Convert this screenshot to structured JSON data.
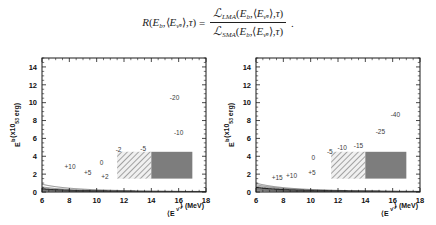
{
  "equation": {
    "lhs_fn": "R",
    "lhs_args": "(E_b, <E_nuebar>, tau)",
    "equals": "=",
    "numerator": "L_LMA(E_b, <E_nuebar>, tau)",
    "denominator": "L_SMA(E_b, <E_nuebar>, tau)",
    "R_symbol": "R",
    "E_symbol": "E",
    "b_sub": "b",
    "angle_open": "⟨",
    "angle_close": "⟩",
    "nuebar_sub": "ν̄",
    "e_subsub": "e",
    "tau_symbol": "τ",
    "L_symbol": "ℒ",
    "lma_sub": "LMA",
    "sma_sub": "SMA",
    "comma": ",",
    "paren_open": "(",
    "paren_close": ")",
    "period": "."
  },
  "axes": {
    "x_label_main": "⟨E",
    "x_label_sub": "ν̄",
    "x_label_subsub": "e",
    "x_label_close": "⟩",
    "x_label_unit": "(MeV)",
    "y_label_main": "E",
    "y_label_sub": "b",
    "y_label_unit": "(x10",
    "y_label_exp": "53",
    "y_label_unit2": " erg)",
    "x_ticks": [
      6,
      8,
      10,
      12,
      14,
      16,
      18
    ],
    "y_ticks": [
      0,
      2,
      4,
      6,
      8,
      10,
      12,
      14
    ],
    "x_range": [
      6,
      18
    ],
    "y_range": [
      0,
      15
    ]
  },
  "chart_data": {
    "type": "contour",
    "title": "",
    "panels": [
      {
        "name": "left-panel",
        "id": "left",
        "xlabel": "<E_nuebar> (MeV)",
        "ylabel": "E_b (x10^53 erg)",
        "xlim": [
          6,
          18
        ],
        "ylim": [
          0,
          15
        ],
        "grid": false,
        "contour_levels": [
          10,
          5,
          2,
          0,
          -2,
          -5,
          -10,
          -20
        ],
        "contour_constants": [
          70,
          46,
          33,
          27.5,
          23.5,
          19.5,
          14.5,
          9.2
        ],
        "labels": [
          {
            "text": "+10",
            "x": 8.05,
            "y": 2.55
          },
          {
            "text": "+5",
            "x": 9.35,
            "y": 1.85
          },
          {
            "text": "+2",
            "x": 10.6,
            "y": 1.45
          },
          {
            "text": "0",
            "x": 10.35,
            "y": 3.05
          },
          {
            "text": "-2",
            "x": 11.6,
            "y": 4.45
          },
          {
            "text": "-5",
            "x": 13.4,
            "y": 4.6
          },
          {
            "text": "-10",
            "x": 16.0,
            "y": 6.4
          },
          {
            "text": "-20",
            "x": 15.7,
            "y": 10.3
          }
        ],
        "boxes": [
          {
            "style": "hatched",
            "x0": 11.5,
            "x1": 14.0,
            "y0": 1.5,
            "y1": 4.5
          },
          {
            "style": "solid",
            "x0": 14.0,
            "x1": 17.0,
            "y0": 1.5,
            "y1": 4.5
          }
        ]
      },
      {
        "name": "right-panel",
        "id": "right",
        "xlabel": "<E_nuebar> (MeV)",
        "ylabel": "E_b (x10^53 erg)",
        "xlim": [
          6,
          18
        ],
        "ylim": [
          0,
          15
        ],
        "grid": false,
        "contour_levels": [
          15,
          10,
          5,
          0,
          -5,
          -10,
          -15,
          -25,
          -40
        ],
        "contour_constants": [
          80,
          66,
          53,
          41,
          33,
          27.5,
          23.0,
          17.0,
          11.3
        ],
        "labels": [
          {
            "text": "+15",
            "x": 7.55,
            "y": 1.35
          },
          {
            "text": "+10",
            "x": 8.6,
            "y": 1.55
          },
          {
            "text": "+5",
            "x": 10.1,
            "y": 1.95
          },
          {
            "text": "0",
            "x": 10.2,
            "y": 3.6
          },
          {
            "text": "-5",
            "x": 11.4,
            "y": 4.3
          },
          {
            "text": "-10",
            "x": 12.3,
            "y": 4.7
          },
          {
            "text": "-15",
            "x": 13.5,
            "y": 4.95
          },
          {
            "text": "-25",
            "x": 15.1,
            "y": 6.5
          },
          {
            "text": "-40",
            "x": 16.2,
            "y": 8.4
          }
        ],
        "boxes": [
          {
            "style": "hatched",
            "x0": 11.5,
            "x1": 14.0,
            "y0": 1.5,
            "y1": 4.5
          },
          {
            "style": "solid",
            "x0": 14.0,
            "x1": 17.0,
            "y0": 1.5,
            "y1": 4.5
          }
        ]
      }
    ]
  }
}
